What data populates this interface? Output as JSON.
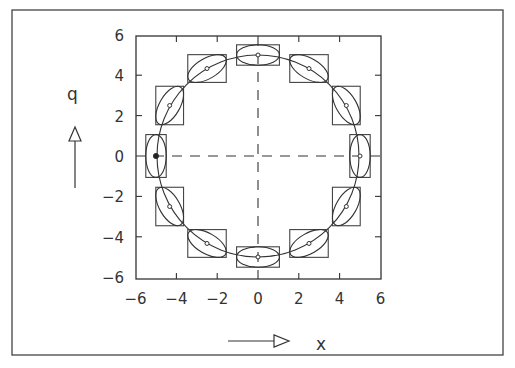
{
  "figure": {
    "x_axis_label": "x",
    "y_axis_label": "q",
    "x_ticks": [
      "-6",
      "-4",
      "-2",
      "0",
      "2",
      "4",
      "6"
    ],
    "y_ticks": [
      "6",
      "4",
      "2",
      "0",
      "-2",
      "-4",
      "-6"
    ],
    "line_color": "#333333",
    "background": "#ffffff"
  },
  "chart_data": {
    "type": "scatter",
    "title": "",
    "xlabel": "x",
    "ylabel": "q",
    "xlim": [
      -6,
      6
    ],
    "ylim": [
      -6,
      6
    ],
    "x_ticks": [
      -6,
      -4,
      -2,
      0,
      2,
      4,
      6
    ],
    "y_ticks": [
      -6,
      -4,
      -2,
      0,
      2,
      4,
      6
    ],
    "grid": false,
    "reference_lines": [
      {
        "type": "dashed",
        "orientation": "horizontal",
        "value": 0
      },
      {
        "type": "dashed",
        "orientation": "vertical",
        "value": 0
      }
    ],
    "trajectory": {
      "shape": "circle",
      "center": [
        0,
        0
      ],
      "radius": 5
    },
    "points": [
      {
        "x": -5.0,
        "y": 0.0,
        "ellipse_angle_deg": 90,
        "marker": "filled"
      },
      {
        "x": -4.33,
        "y": 2.5,
        "ellipse_angle_deg": 60,
        "marker": "open"
      },
      {
        "x": -2.5,
        "y": 4.33,
        "ellipse_angle_deg": 30,
        "marker": "open"
      },
      {
        "x": 0.0,
        "y": 5.0,
        "ellipse_angle_deg": 0,
        "marker": "open"
      },
      {
        "x": 2.5,
        "y": 4.33,
        "ellipse_angle_deg": -30,
        "marker": "open"
      },
      {
        "x": 4.33,
        "y": 2.5,
        "ellipse_angle_deg": -60,
        "marker": "open"
      },
      {
        "x": 5.0,
        "y": 0.0,
        "ellipse_angle_deg": 90,
        "marker": "open"
      },
      {
        "x": 4.33,
        "y": -2.5,
        "ellipse_angle_deg": 60,
        "marker": "open"
      },
      {
        "x": 2.5,
        "y": -4.33,
        "ellipse_angle_deg": 30,
        "marker": "open"
      },
      {
        "x": 0.0,
        "y": -5.0,
        "ellipse_angle_deg": 0,
        "marker": "open"
      },
      {
        "x": -2.5,
        "y": -4.33,
        "ellipse_angle_deg": -30,
        "marker": "open"
      },
      {
        "x": -4.33,
        "y": -2.5,
        "ellipse_angle_deg": -60,
        "marker": "open"
      }
    ],
    "ellipse": {
      "semi_major": 1.05,
      "semi_minor": 0.5
    },
    "annotations": [
      {
        "text": "q",
        "arrow": "up"
      },
      {
        "text": "x",
        "arrow": "right"
      }
    ]
  }
}
